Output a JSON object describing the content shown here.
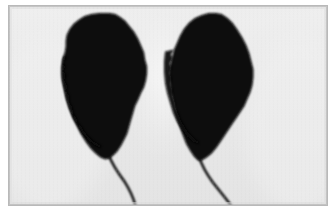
{
  "figure": {
    "kind": "scanned-photograph",
    "caption": "Two dark leaf silhouettes with slender stems on a pale grey background",
    "subject_count": 2,
    "background_color": "#e9e9e9",
    "highlight_color": "#f7f7f7",
    "subject_color": "#070707",
    "border_color": "#b9b9b9",
    "page_color": "#ffffff",
    "frame": {
      "left": 8,
      "top": 5,
      "width": 320,
      "height": 201,
      "border_width": 1
    },
    "specimens": [
      {
        "id": "left-leaf",
        "label": "Left leaf silhouette",
        "apex": {
          "x": 101,
          "y": 7
        },
        "stem_tip": {
          "x": 128,
          "y": 201
        },
        "blade_outline": "M 101 7 L 108 9 L 114 13 L 119 18 L 124 25 L 129 33 L 133 41 L 136 48 L 138 55 L 139 62 L 139 69 L 138 76 L 136 83 L 133 90 L 130 97 L 127 104 L 124 110 L 122 117 L 120 124 L 118 131 L 116 137 L 113 143 L 110 148 L 106 152 L 102 155 L 98 156 L 93 155 L 88 152 L 83 147 L 78 141 L 73 134 L 68 126 L 64 118 L 61 110 L 58 101 L 55 92 L 53 83 L 52 74 L 52 66 L 53 58 L 55 51 L 57 45 L 58 39 L 58 33 L 59 27 L 62 22 L 66 17 L 71 13 L 77 10 L 84 8 L 91 7 Z",
        "stem_path": "M 100 154 C 104 162, 110 170, 116 178 C 121 185, 125 193, 127 201"
      },
      {
        "id": "right-leaf",
        "label": "Right leaf silhouette",
        "apex": {
          "x": 208,
          "y": 7
        },
        "stem_tip": {
          "x": 228,
          "y": 201
        },
        "blade_outline": "M 208 7 L 215 9 L 221 13 L 226 19 L 231 26 L 236 34 L 240 43 L 243 51 L 245 59 L 246 67 L 246 75 L 245 83 L 243 90 L 240 97 L 236 104 L 232 110 L 228 116 L 224 122 L 220 128 L 216 134 L 212 140 L 207 146 L 202 151 L 197 155 L 192 157 L 188 156 L 184 152 L 180 146 L 176 139 L 172 131 L 169 123 L 166 114 L 164 105 L 162 96 L 161 87 L 160 78 L 160 69 L 161 60 L 163 52 L 165 45 L 168 38 L 171 31 L 175 24 L 180 18 L 186 13 L 193 10 L 200 8 Z",
        "stem_path": "M 191 156 C 194 164, 199 172, 205 180 C 212 188, 219 195, 224 201"
      }
    ],
    "highlights": [
      {
        "id": "top-glow",
        "cx": 180,
        "cy": 0,
        "rx": 150,
        "ry": 40
      },
      {
        "id": "gap-glow",
        "cx": 155,
        "cy": 70,
        "rx": 30,
        "ry": 70
      }
    ]
  }
}
